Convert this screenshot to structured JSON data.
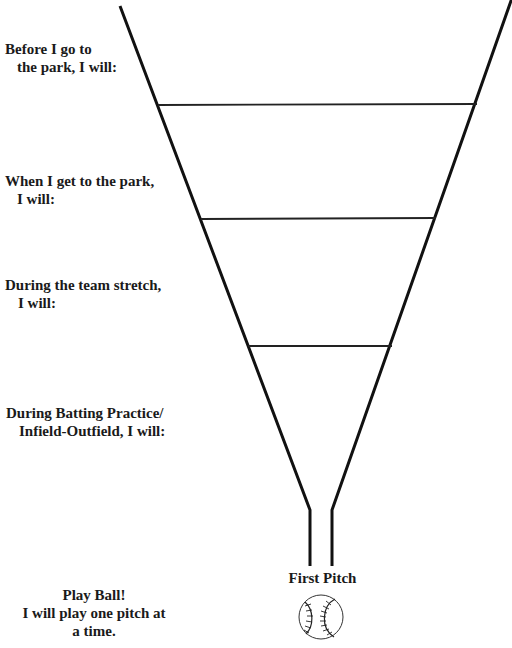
{
  "stages": [
    {
      "line1": "Before I go to",
      "line2": "the park, I will:"
    },
    {
      "line1": "When I get to the park,",
      "line2": "I will:"
    },
    {
      "line1": "During the team stretch,",
      "line2": "I will:"
    },
    {
      "line1": "During Batting Practice/",
      "line2": "Infield-Outfield, I will:"
    }
  ],
  "finale": {
    "title": "Play Ball!",
    "line2": "I will play one pitch at",
    "line3": "a time."
  },
  "funnel_end_label": "First Pitch",
  "icon": "baseball-icon",
  "colors": {
    "line": "#111111",
    "text": "#1a1a1a",
    "background": "#ffffff"
  }
}
